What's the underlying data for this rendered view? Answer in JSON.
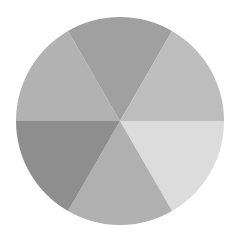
{
  "chart_data": {
    "type": "pie",
    "title": "",
    "categories": [
      "Slice 1",
      "Slice 2",
      "Slice 3",
      "Slice 4",
      "Slice 5",
      "Slice 6"
    ],
    "values": [
      16.67,
      16.67,
      16.67,
      16.67,
      16.67,
      16.67
    ],
    "colors": [
      "#dcdcdc",
      "#b0b0b0",
      "#8e8e8e",
      "#b2b2b2",
      "#a0a0a0",
      "#bdbdbd"
    ],
    "start_angle_deg": 0,
    "direction": "clockwise",
    "labels_visible": false,
    "legend": "none"
  },
  "geometry": {
    "cx": 120,
    "cy": 121,
    "r": 104
  }
}
